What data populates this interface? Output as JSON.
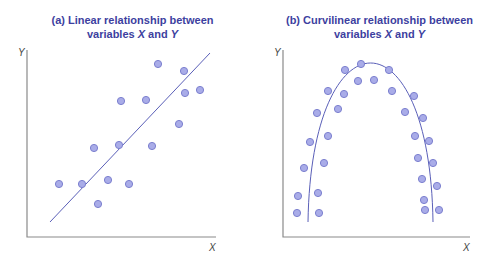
{
  "chart_data": [
    {
      "type": "scatter",
      "title": "(a) Linear relationship between variables X and Y",
      "xlabel": "X",
      "ylabel": "Y",
      "grid": false,
      "trend": "linear",
      "points": [
        [
          158,
          64
        ],
        [
          184,
          71
        ],
        [
          185,
          93
        ],
        [
          200,
          90
        ],
        [
          121,
          101
        ],
        [
          146,
          100
        ],
        [
          179,
          124
        ],
        [
          94,
          148
        ],
        [
          119,
          145
        ],
        [
          152,
          146
        ],
        [
          59,
          184
        ],
        [
          82,
          184
        ],
        [
          108,
          180
        ],
        [
          129,
          184
        ],
        [
          98,
          204
        ]
      ],
      "fit_line": [
        [
          50,
          222
        ],
        [
          210,
          53
        ]
      ]
    },
    {
      "type": "scatter",
      "title": "(b) Curvilinear relationship between variables X and Y",
      "xlabel": "X",
      "ylabel": "Y",
      "grid": false,
      "trend": "inverted-U",
      "points": [
        [
          361,
          64
        ],
        [
          345,
          70
        ],
        [
          389,
          70
        ],
        [
          358,
          81
        ],
        [
          374,
          80
        ],
        [
          328,
          91
        ],
        [
          344,
          94
        ],
        [
          392,
          91
        ],
        [
          414,
          96
        ],
        [
          317,
          113
        ],
        [
          338,
          109
        ],
        [
          405,
          112
        ],
        [
          423,
          118
        ],
        [
          310,
          142
        ],
        [
          328,
          136
        ],
        [
          415,
          136
        ],
        [
          429,
          141
        ],
        [
          304,
          168
        ],
        [
          324,
          163
        ],
        [
          418,
          158
        ],
        [
          433,
          163
        ],
        [
          298,
          196
        ],
        [
          318,
          193
        ],
        [
          422,
          179
        ],
        [
          437,
          186
        ],
        [
          297,
          213
        ],
        [
          319,
          213
        ],
        [
          424,
          200
        ],
        [
          425,
          210
        ],
        [
          439,
          210
        ]
      ],
      "fit_curve": {
        "start": [
          308,
          222
        ],
        "peak": [
          373,
          70
        ],
        "end": [
          433,
          222
        ]
      }
    }
  ],
  "panels": {
    "a": {
      "title_line1": "(a) Linear relationship between",
      "title_line2_pre": "variables ",
      "title_x": "X",
      "title_and": " and ",
      "title_y": "Y",
      "xlabel": "X",
      "ylabel": "Y"
    },
    "b": {
      "title_line1": "(b) Curvilinear relationship between",
      "title_line2_pre": "variables ",
      "title_x": "X",
      "title_and": " and ",
      "title_y": "Y",
      "xlabel": "X",
      "ylabel": "Y"
    }
  },
  "colors": {
    "title": "#3d3fa0",
    "point_fill": "#a9ace8",
    "point_stroke": "#7c80cf",
    "line": "#5a5fb8",
    "axis": "#8a8a8a"
  }
}
